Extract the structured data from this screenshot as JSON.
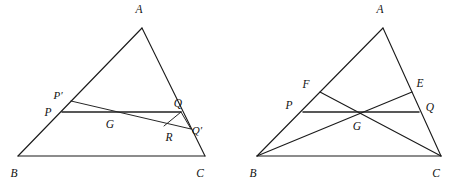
{
  "figure": {
    "background_color": "#ffffff",
    "stroke_color": "#1a1a1a",
    "width": 459,
    "height": 186
  },
  "left_figure": {
    "name": "triangle-with-sliding-chord",
    "labels": {
      "A": "A",
      "B": "B",
      "C": "C",
      "P": "P",
      "P_prime": "P′",
      "Q": "Q",
      "Q_prime": "Q′",
      "G": "G",
      "R": "R"
    },
    "points": {
      "A": [
        142,
        28
      ],
      "B": [
        18,
        156
      ],
      "C": [
        205,
        156
      ],
      "P": [
        62,
        112
      ],
      "P_prime": [
        71,
        101
      ],
      "Q": [
        181,
        112
      ],
      "Q_prime": [
        191,
        129
      ],
      "G": [
        118,
        118
      ],
      "R": [
        167,
        126
      ]
    },
    "segments": [
      [
        "A",
        "B"
      ],
      [
        "A",
        "C"
      ],
      [
        "B",
        "C"
      ],
      [
        "P",
        "Q"
      ],
      [
        "P_prime",
        "Q_prime"
      ],
      [
        "Q",
        "R"
      ],
      [
        "Q",
        "Q_prime"
      ]
    ],
    "label_positions": {
      "A": [
        139,
        13
      ],
      "B": [
        14,
        177
      ],
      "C": [
        200,
        177
      ],
      "P": [
        48,
        116
      ],
      "P_prime": [
        58,
        99
      ],
      "Q": [
        178,
        107
      ],
      "Q_prime": [
        194,
        132
      ],
      "G": [
        110,
        128
      ],
      "R": [
        169,
        140
      ]
    }
  },
  "right_figure": {
    "name": "triangle-with-medians-centroid",
    "labels": {
      "A": "A",
      "B": "B",
      "C": "C",
      "P": "P",
      "Q": "Q",
      "E": "E",
      "F": "F",
      "G": "G"
    },
    "points": {
      "A": [
        383,
        28
      ],
      "B": [
        257,
        156
      ],
      "C": [
        441,
        156
      ],
      "P": [
        303,
        112
      ],
      "Q": [
        419,
        112
      ],
      "E": [
        412,
        92
      ],
      "F": [
        320,
        92
      ],
      "G": [
        362,
        112
      ]
    },
    "segments": [
      [
        "A",
        "B"
      ],
      [
        "A",
        "C"
      ],
      [
        "B",
        "C"
      ],
      [
        "P",
        "Q"
      ],
      [
        "B",
        "E"
      ],
      [
        "C",
        "F"
      ]
    ],
    "label_positions": {
      "A": [
        380,
        13
      ],
      "B": [
        253,
        177
      ],
      "C": [
        436,
        177
      ],
      "P": [
        289,
        108
      ],
      "Q": [
        427,
        110
      ],
      "E": [
        417,
        86
      ],
      "F": [
        305,
        87
      ],
      "G": [
        357,
        129
      ]
    }
  }
}
